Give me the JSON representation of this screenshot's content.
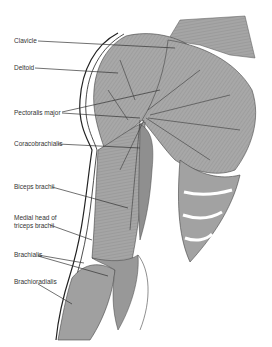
{
  "figure": {
    "colors": {
      "muscle_fill": "#a9a9a9",
      "muscle_dark": "#7a7a7a",
      "outline": "#222222",
      "leader_line": "#333333",
      "background": "#ffffff"
    },
    "labels": [
      {
        "id": "clavicle",
        "text": "Clavicle",
        "x": 14,
        "y": 38
      },
      {
        "id": "deltoid",
        "text": "Deltoid",
        "x": 14,
        "y": 65
      },
      {
        "id": "pectoralis-major",
        "text": "Pectoralis major",
        "x": 14,
        "y": 110
      },
      {
        "id": "coracobrachialis",
        "text": "Coracobrachialis",
        "x": 14,
        "y": 141
      },
      {
        "id": "biceps-brachii",
        "text": "Biceps brachii",
        "x": 14,
        "y": 184
      },
      {
        "id": "medial-head-triceps",
        "text": "Medial head of\ntriceps brachii",
        "x": 14,
        "y": 216
      },
      {
        "id": "brachialis",
        "text": "Brachialis",
        "x": 14,
        "y": 252
      },
      {
        "id": "brachioradialis",
        "text": "Brachioradialis",
        "x": 14,
        "y": 279
      }
    ]
  }
}
